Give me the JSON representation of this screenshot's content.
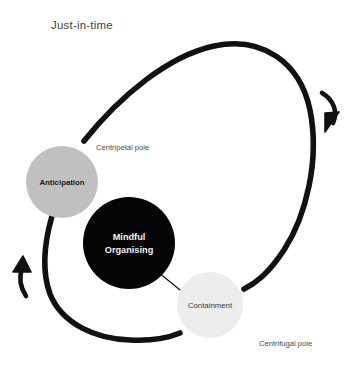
{
  "diagram": {
    "title": "Just-in-time",
    "nodes": [
      {
        "id": "anticipation",
        "label": "Anticipation",
        "fill": "#c0c0c0",
        "cx": 62,
        "cy": 182,
        "r": 36
      },
      {
        "id": "mindful-organising",
        "label_line1": "Mindful",
        "label_line2": "Organising",
        "fill": "#050505",
        "cx": 129,
        "cy": 243,
        "r": 46
      },
      {
        "id": "containment",
        "label": "Containment",
        "fill": "#ededed",
        "cx": 210,
        "cy": 305,
        "r": 33
      }
    ],
    "annotations": [
      {
        "id": "centripetal-pole",
        "text": "Centripetal pole",
        "x": 96,
        "y": 150
      },
      {
        "id": "centrifugal-pole",
        "text": "Centrifugal pole",
        "x": 259,
        "y": 346
      }
    ],
    "arrows": [
      {
        "id": "clockwise-arrow-right",
        "direction": "down-right"
      },
      {
        "id": "counterclockwise-arrow-left",
        "direction": "up"
      }
    ],
    "colors": {
      "stroke": "#111111",
      "background": "#ffffff",
      "title": "#3f3f3f",
      "label": "#4a4a4a"
    }
  }
}
